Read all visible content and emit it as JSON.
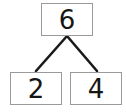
{
  "diagram": {
    "type": "number-bond",
    "whole": {
      "label": "6",
      "value": 6
    },
    "parts": [
      {
        "label": "2",
        "value": 2
      },
      {
        "label": "4",
        "value": 4
      }
    ],
    "connectors": [
      {
        "from": "whole",
        "to": "part-left"
      },
      {
        "from": "whole",
        "to": "part-right"
      }
    ],
    "colors": {
      "background": "#ffffff",
      "box_border": "#9a9a9a",
      "connector_line": "#1a1a1a",
      "digit": "#151515"
    }
  }
}
